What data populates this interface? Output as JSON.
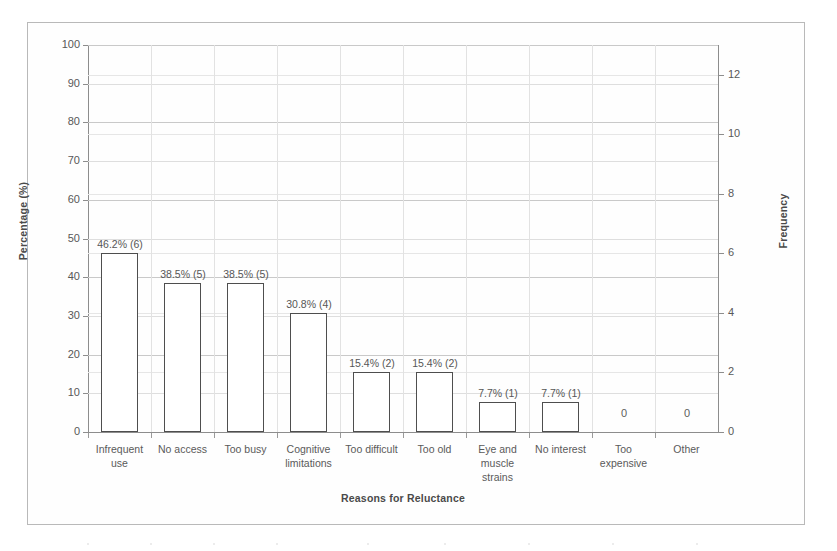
{
  "chart_data": {
    "type": "bar",
    "title": "",
    "xlabel": "Reasons for Reluctance",
    "ylabel": "Percentage (%)",
    "y2label": "Frequency",
    "categories": [
      "Infrequent use",
      "No access",
      "Too busy",
      "Cognitive limitations",
      "Too difficult",
      "Too old",
      "Eye and muscle strains",
      "No interest",
      "Too expensive",
      "Other"
    ],
    "category_lines": [
      [
        "Infrequent",
        "use"
      ],
      [
        "No access"
      ],
      [
        "Too busy"
      ],
      [
        "Cognitive",
        "limitations"
      ],
      [
        "Too difficult"
      ],
      [
        "Too old"
      ],
      [
        "Eye and",
        "muscle",
        "strains"
      ],
      [
        "No interest"
      ],
      [
        "Too",
        "expensive"
      ],
      [
        "Other"
      ]
    ],
    "values": [
      46.2,
      38.5,
      38.5,
      30.8,
      15.4,
      15.4,
      7.7,
      7.7,
      0,
      0
    ],
    "frequencies": [
      6,
      5,
      5,
      4,
      2,
      2,
      1,
      1,
      0,
      0
    ],
    "data_labels": [
      "46.2% (6)",
      "38.5% (5)",
      "38.5% (5)",
      "30.8% (4)",
      "15.4% (2)",
      "15.4% (2)",
      "7.7% (1)",
      "7.7% (1)",
      "0",
      "0"
    ],
    "ylim": [
      0,
      100
    ],
    "yticks": [
      0,
      10,
      20,
      30,
      40,
      50,
      60,
      70,
      80,
      90,
      100
    ],
    "y2lim": [
      0,
      13
    ],
    "y2ticks": [
      0,
      2,
      4,
      6,
      8,
      10,
      12
    ],
    "grid": true,
    "legend": "none",
    "bar_fill": "#ffffff",
    "bar_edge": "#4e4e4e",
    "grid_color": "#c9c9c9",
    "axis_color": "#8d8d8d",
    "text_color": "#5a5a5a"
  }
}
